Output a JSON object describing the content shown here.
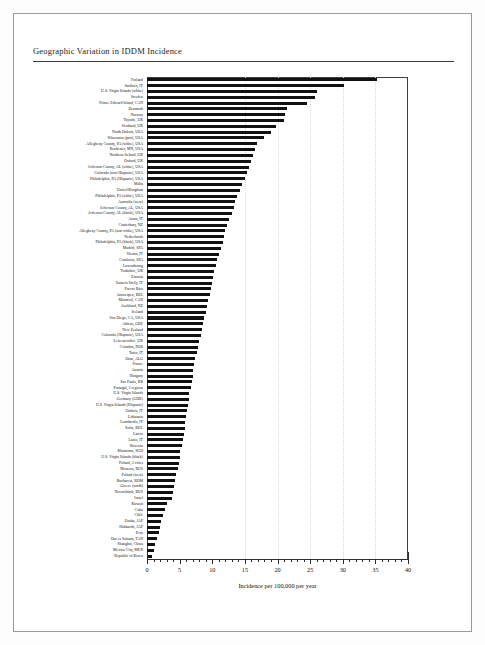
{
  "page": {
    "header_title": "Geographic Variation in IDDM Incidence"
  },
  "axis": {
    "x_title": "Incidence per 100,000 per year",
    "x_ticks": [
      "0",
      "5",
      "10",
      "15",
      "20",
      "25",
      "30",
      "35",
      "40"
    ]
  },
  "chart_data": {
    "type": "bar",
    "orientation": "horizontal",
    "title": "Geographic Variation in IDDM Incidence",
    "xlabel": "Incidence per 100,000 per year",
    "ylabel": "",
    "xlim": [
      0,
      40
    ],
    "grid": false,
    "legend": "none",
    "bar_color": "#111111",
    "categories": [
      "Finland",
      "Sardinia, IT",
      "U.S. Virgin Islands (white)",
      "Sweden",
      "Prince Edward Island, CAN",
      "Denmark",
      "Norway",
      "Tayside, UK",
      "Scotland, UK",
      "North Dakota, USA",
      "Wisconsin (part), USA",
      "Allegheny County, PA (white), USA",
      "Rochester, MN, USA",
      "Northern Ireland, UK",
      "Oxford, UK",
      "Jefferson County, AL (white), USA",
      "Colorado (non-Hispanic), USA",
      "Philadelphia, PA (Hispanic), USA",
      "Malta",
      "United Kingdom",
      "Philadelphia, PA (white), USA",
      "Australia (west)",
      "Jefferson County, AL, USA",
      "Jefferson County, AL (black), USA",
      "Aosta, IT",
      "Canterbury, NZ",
      "Allegheny County, PA (non-white), USA",
      "Netherlands",
      "Philadelphia, PA (black), USA",
      "Madrid, SPA",
      "Vienna, IT",
      "Catalonia, SPA",
      "Luxembourg",
      "Yorkshire, UK",
      "Estonia",
      "Eastern Sicily, IT",
      "Puerto Rico",
      "Antwerpen, BEL",
      "Montreal, CAN",
      "Auckland, NZ",
      "Iceland",
      "San Diego, CA, USA",
      "Athens, GRE",
      "New Zealand",
      "Colorado (Hispanic), USA",
      "Leicestershire, UK",
      "Coimbra, POR",
      "Turin, IT",
      "Oran, ALG",
      "France",
      "Austria",
      "Hungary",
      "Sao Paulo, BR",
      "Portugal, 3 regions",
      "U.S. Virgin Islands",
      "Germany (GDR)",
      "U.S. Virgin Islands (Hispanic)",
      "Umbria, IT",
      "Lithuania",
      "Lombardia, IT",
      "Sofia, BUL",
      "Latvia",
      "Lazio, IT",
      "Slovenia",
      "Khartoum, SUD",
      "U.S. Virgin Islands (black)",
      "Poland, 3 cities",
      "Moscow, RUS",
      "Poland (west)",
      "Bucharest, ROM",
      "Greece (north)",
      "Novosibirsk, RUS",
      "Israel",
      "Kuwait",
      "Cuba",
      "Chile",
      "Osaka, JAP",
      "Hokkaido, JAP",
      "Peru",
      "Dar es Salaam, TAN",
      "Shanghai, China",
      "Mexico City, MEX",
      "Republic of Korea"
    ],
    "values": [
      35.3,
      30.2,
      26.0,
      25.8,
      24.5,
      21.5,
      21.2,
      21.0,
      19.8,
      19.0,
      18.0,
      16.8,
      16.5,
      16.3,
      16.0,
      15.6,
      15.3,
      15.0,
      14.6,
      14.3,
      13.8,
      13.5,
      13.3,
      13.0,
      12.6,
      12.3,
      12.0,
      11.8,
      11.6,
      11.3,
      11.0,
      10.8,
      10.5,
      10.3,
      10.1,
      10.0,
      9.8,
      9.6,
      9.4,
      9.2,
      9.0,
      8.8,
      8.6,
      8.4,
      8.2,
      8.0,
      7.8,
      7.6,
      7.4,
      7.2,
      7.1,
      7.0,
      6.9,
      6.7,
      6.5,
      6.4,
      6.3,
      6.2,
      6.0,
      5.9,
      5.8,
      5.7,
      5.5,
      5.3,
      5.1,
      5.0,
      4.9,
      4.7,
      4.5,
      4.3,
      4.2,
      4.0,
      3.8,
      3.0,
      2.8,
      2.5,
      2.2,
      2.0,
      1.8,
      1.5,
      1.2,
      1.0,
      0.8
    ]
  }
}
